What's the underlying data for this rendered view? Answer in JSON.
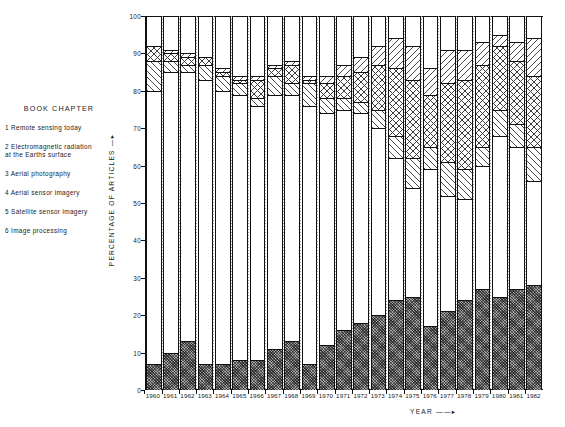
{
  "legend": {
    "title": "BOOK CHAPTER",
    "items": [
      {
        "num": "1",
        "label": "1 Remote sensing today"
      },
      {
        "num": "2",
        "label": "2 Electromagnetic  radiation\n    at  the  Earths  surface"
      },
      {
        "num": "3",
        "label": "3 Aerial  photography"
      },
      {
        "num": "4",
        "label": "4 Aerial  sensor  imagery"
      },
      {
        "num": "5",
        "label": "5 Satellite  sensor  imagery"
      },
      {
        "num": "6",
        "label": "6 Image  processing"
      }
    ]
  },
  "axes": {
    "ylabel": "PERCENTAGE  OF  ARTICLES  —▸",
    "xlabel": "YEAR ——▸",
    "yticks": [
      "0",
      "10",
      "20",
      "30",
      "40",
      "50",
      "60",
      "70",
      "80",
      "90",
      "100"
    ],
    "ymin": 0,
    "ymax": 100
  },
  "chart_data": {
    "type": "bar",
    "title": "",
    "subtitle": "",
    "xlabel": "YEAR ——▸",
    "ylabel": "PERCENTAGE  OF  ARTICLES  —▸",
    "ylim": [
      0,
      100
    ],
    "grid": true,
    "stacked": true,
    "legend_position": "left",
    "categories": [
      "1960",
      "1961",
      "1962",
      "1963",
      "1964",
      "1965",
      "1966",
      "1967",
      "1968",
      "1969",
      "1970",
      "1971",
      "1972",
      "1973",
      "1974",
      "1975",
      "1976",
      "1977",
      "1978",
      "1979",
      "1980",
      "1981",
      "1982"
    ],
    "series": [
      {
        "name": "1 Remote sensing today",
        "pattern": "dark-crosshatch",
        "values": [
          7,
          10,
          13,
          7,
          7,
          8,
          8,
          11,
          13,
          7,
          12,
          16,
          18,
          20,
          24,
          25,
          17,
          21,
          24,
          27,
          25,
          27,
          28
        ]
      },
      {
        "name": "2 Electromagnetic radiation at the Earths surface",
        "pattern": "fine-dots",
        "values": [
          73,
          75,
          72,
          76,
          73,
          71,
          68,
          68,
          66,
          69,
          62,
          59,
          56,
          50,
          38,
          29,
          42,
          31,
          27,
          33,
          43,
          38,
          28
        ]
      },
      {
        "name": "3 Aerial photography",
        "pattern": "diagonal-hatch",
        "values": [
          8,
          3,
          2,
          4,
          4,
          3,
          2,
          5,
          3,
          6,
          4,
          3,
          3,
          5,
          6,
          8,
          6,
          9,
          8,
          5,
          7,
          6,
          9
        ]
      },
      {
        "name": "4 Aerial sensor imagery",
        "pattern": "cross-hatch",
        "values": [
          4,
          2,
          2,
          2,
          1,
          1,
          5,
          2,
          5,
          1,
          4,
          6,
          8,
          12,
          18,
          21,
          14,
          21,
          24,
          22,
          17,
          17,
          19
        ]
      },
      {
        "name": "5 Satellite sensor imagery",
        "pattern": "reverse-diagonal",
        "values": [
          0,
          1,
          1,
          0,
          1,
          1,
          1,
          1,
          1,
          1,
          2,
          3,
          4,
          5,
          8,
          9,
          7,
          9,
          8,
          6,
          3,
          5,
          10
        ]
      },
      {
        "name": "6 Image processing",
        "pattern": "blank",
        "values": [
          8,
          9,
          10,
          11,
          14,
          16,
          16,
          13,
          12,
          16,
          16,
          13,
          11,
          8,
          6,
          8,
          14,
          9,
          9,
          7,
          5,
          7,
          6
        ]
      }
    ]
  }
}
